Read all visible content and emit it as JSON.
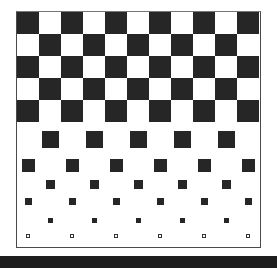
{
  "figure": {
    "colors": {
      "dark": "#262626",
      "light": "#ffffff",
      "border": "#4a4a4a",
      "bottom_bar": "#1e1e1e"
    },
    "grid": {
      "columns": 11,
      "cell_size": 22,
      "full_checker_rows": 5
    },
    "shrinking_rows": [
      {
        "row": 5,
        "parity": "odd",
        "size": 17,
        "center_y": 127
      },
      {
        "row": 6,
        "parity": "even",
        "size": 13,
        "center_y": 153
      },
      {
        "row": 7,
        "parity": "odd",
        "size": 9,
        "center_y": 172
      },
      {
        "row": 8,
        "parity": "even",
        "size": 7,
        "center_y": 189
      },
      {
        "row": 9,
        "parity": "odd",
        "size": 5,
        "center_y": 208
      },
      {
        "row": 10,
        "parity": "even",
        "size": 4,
        "center_y": 224,
        "hollow": true
      }
    ]
  }
}
